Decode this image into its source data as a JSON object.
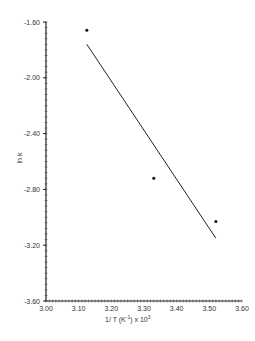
{
  "chart_data": {
    "type": "scatter",
    "title": "",
    "xlabel": "1/T (K⁻¹) x 10³",
    "ylabel": "ln k",
    "xlim": [
      3.0,
      3.6
    ],
    "ylim": [
      -3.6,
      -1.6
    ],
    "x_ticks": [
      "3.00",
      "3.10",
      "3.20",
      "3.30",
      "3.40",
      "3.50",
      "3.60"
    ],
    "y_ticks": [
      "-1.60",
      "-2.00",
      "-2.40",
      "-2.80",
      "-3.20",
      "-3.60"
    ],
    "grid": false,
    "legend": null,
    "series": [
      {
        "name": "data points",
        "type": "scatter",
        "x": [
          3.125,
          3.33,
          3.52
        ],
        "y": [
          -1.66,
          -2.72,
          -3.03
        ]
      },
      {
        "name": "linear fit",
        "type": "line",
        "x": [
          3.125,
          3.52
        ],
        "y": [
          -1.76,
          -3.15
        ]
      }
    ]
  },
  "labels": {
    "xlabel_main": "1/ T  (K",
    "xlabel_sup": "-1",
    "xlabel_tail": ")  x 10",
    "xlabel_exp": "3",
    "ylabel": "ln k"
  }
}
